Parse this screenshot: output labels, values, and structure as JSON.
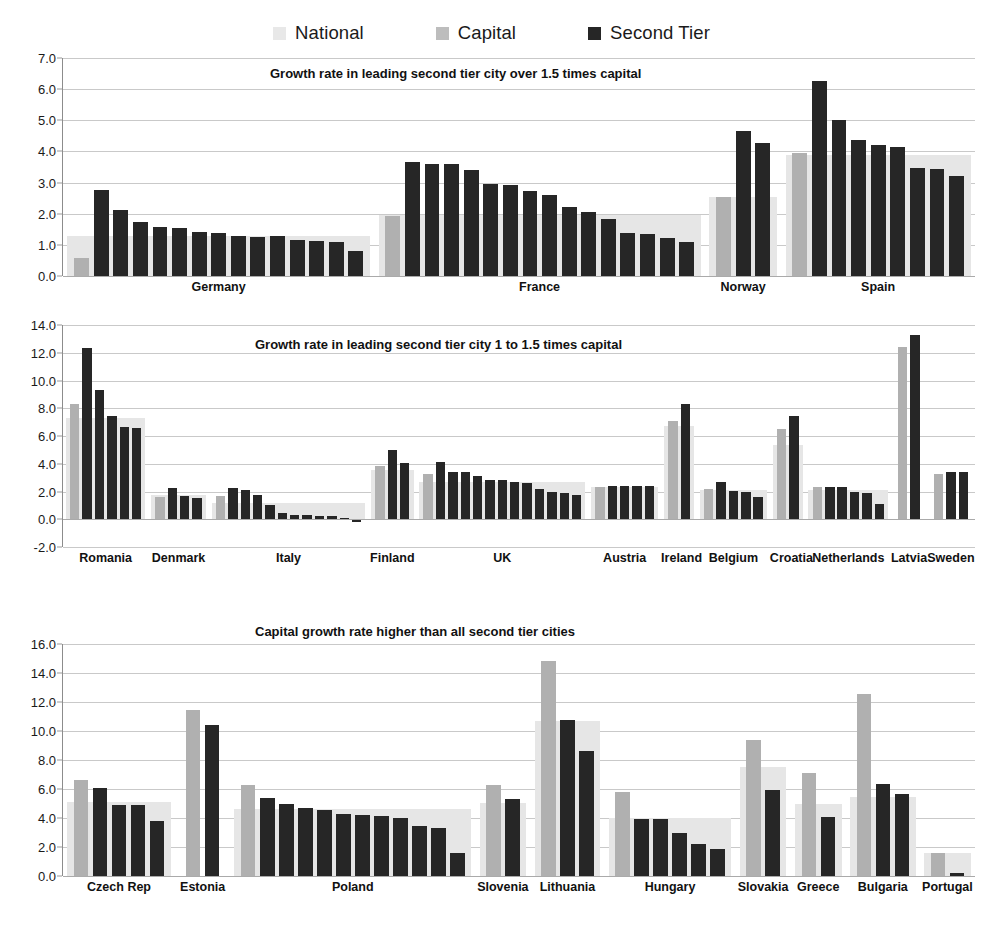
{
  "legend": {
    "entries": [
      {
        "label": "National",
        "color": "#e6e6e6"
      },
      {
        "label": "Capital",
        "color": "#b0b0b0"
      },
      {
        "label": "Second Tier",
        "color": "#262626"
      }
    ]
  },
  "chart_data": [
    {
      "type": "bar",
      "title": "Growth rate in leading second tier city over 1.5 times capital",
      "xlabel": "",
      "ylabel": "",
      "ylim": [
        0.0,
        7.0
      ],
      "yticks": [
        0.0,
        1.0,
        2.0,
        3.0,
        4.0,
        5.0,
        6.0,
        7.0
      ],
      "ytick_labels": [
        "0.0",
        "1.0",
        "2.0",
        "3.0",
        "4.0",
        "5.0",
        "6.0",
        "7.0"
      ],
      "grid": true,
      "legend_position": "top-center",
      "series_names": [
        "National",
        "Capital",
        "Second Tier"
      ],
      "groups": [
        {
          "category": "Germany",
          "national": 1.3,
          "capital": 0.58,
          "second_tier": [
            2.75,
            2.13,
            1.74,
            1.58,
            1.54,
            1.42,
            1.39,
            1.3,
            1.26,
            1.27,
            1.17,
            1.12,
            1.08,
            0.79
          ]
        },
        {
          "category": "France",
          "national": 1.95,
          "capital": 1.92,
          "second_tier": [
            3.67,
            3.6,
            3.59,
            3.42,
            2.96,
            2.93,
            2.72,
            2.6,
            2.23,
            2.07,
            1.84,
            1.38,
            1.35,
            1.22,
            1.1
          ]
        },
        {
          "category": "Norway",
          "national": 2.55,
          "capital": 2.53,
          "second_tier": [
            4.67,
            4.26
          ]
        },
        {
          "category": "Spain",
          "national": 3.88,
          "capital": 3.94,
          "second_tier": [
            6.26,
            5.01,
            4.37,
            4.22,
            4.14,
            3.48,
            3.45,
            3.22
          ]
        }
      ]
    },
    {
      "type": "bar",
      "title": "Growth rate in leading second tier city 1 to 1.5 times capital",
      "xlabel": "",
      "ylabel": "",
      "ylim": [
        -2.0,
        14.0
      ],
      "yticks": [
        -2.0,
        0.0,
        2.0,
        4.0,
        6.0,
        8.0,
        10.0,
        12.0,
        14.0
      ],
      "ytick_labels": [
        "-2.0",
        "0.0",
        "2.0",
        "4.0",
        "6.0",
        "8.0",
        "10.0",
        "12.0",
        "14.0"
      ],
      "grid": true,
      "legend_position": "top-center",
      "series_names": [
        "National",
        "Capital",
        "Second Tier"
      ],
      "groups": [
        {
          "category": "Romania",
          "national": 7.3,
          "capital": 8.28,
          "second_tier": [
            12.37,
            9.3,
            7.45,
            6.62,
            6.55
          ]
        },
        {
          "category": "Denmark",
          "national": 1.72,
          "capital": 1.62,
          "second_tier": [
            2.28,
            1.66,
            1.52
          ]
        },
        {
          "category": "Italy",
          "national": 1.15,
          "capital": 1.68,
          "second_tier": [
            2.25,
            2.1,
            1.74,
            1.05,
            0.44,
            0.33,
            0.3,
            0.24,
            0.2,
            0.12,
            -0.2
          ]
        },
        {
          "category": "Finland",
          "national": 3.58,
          "capital": 3.85,
          "second_tier": [
            4.96,
            4.07
          ]
        },
        {
          "category": "UK",
          "national": 2.66,
          "capital": 3.28,
          "second_tier": [
            4.13,
            3.42,
            3.4,
            3.12,
            2.85,
            2.83,
            2.65,
            2.6,
            2.15,
            1.95,
            1.9,
            1.72
          ]
        },
        {
          "category": "Austria",
          "national": 2.35,
          "capital": 2.32,
          "second_tier": [
            2.4,
            2.4,
            2.38,
            2.37
          ]
        },
        {
          "category": "Ireland",
          "national": 6.72,
          "capital": 7.05,
          "second_tier": [
            8.28
          ]
        },
        {
          "category": "Belgium",
          "national": 2.1,
          "capital": 2.15,
          "second_tier": [
            2.7,
            2.02,
            2.0,
            1.6
          ]
        },
        {
          "category": "Croatia",
          "national": 5.35,
          "capital": 6.5,
          "second_tier": [
            7.42
          ]
        },
        {
          "category": "Netherlands",
          "national": 2.1,
          "capital": 2.3,
          "second_tier": [
            2.32,
            2.3,
            1.95,
            1.92,
            1.12
          ]
        },
        {
          "category": "Latvia",
          "national": 0.0,
          "capital": 12.45,
          "second_tier": [
            13.3
          ]
        },
        {
          "category": "Sweden",
          "national": 0.0,
          "capital": 3.28,
          "second_tier": [
            3.4,
            3.4
          ]
        }
      ]
    },
    {
      "type": "bar",
      "title": "Capital growth rate higher than all second tier cities",
      "xlabel": "",
      "ylabel": "",
      "ylim": [
        0.0,
        16.0
      ],
      "yticks": [
        0.0,
        2.0,
        4.0,
        6.0,
        8.0,
        10.0,
        12.0,
        14.0,
        16.0
      ],
      "ytick_labels": [
        "0.0",
        "2.0",
        "4.0",
        "6.0",
        "8.0",
        "10.0",
        "12.0",
        "14.0",
        "16.0"
      ],
      "grid": true,
      "legend_position": "top-center",
      "series_names": [
        "National",
        "Capital",
        "Second Tier"
      ],
      "groups": [
        {
          "category": "Czech Rep",
          "national": 5.1,
          "capital": 6.62,
          "second_tier": [
            6.08,
            4.88,
            4.88,
            3.82
          ]
        },
        {
          "category": "Estonia",
          "national": 0.0,
          "capital": 11.45,
          "second_tier": [
            10.42
          ]
        },
        {
          "category": "Poland",
          "national": 4.6,
          "capital": 6.28,
          "second_tier": [
            5.35,
            4.98,
            4.72,
            4.52,
            4.3,
            4.18,
            4.16,
            4.0,
            3.45,
            3.28,
            1.58
          ]
        },
        {
          "category": "Slovenia",
          "national": 5.05,
          "capital": 6.28,
          "second_tier": [
            5.28
          ]
        },
        {
          "category": "Lithuania",
          "national": 10.72,
          "capital": 14.85,
          "second_tier": [
            10.75,
            8.65
          ]
        },
        {
          "category": "Hungary",
          "national": 4.02,
          "capital": 5.8,
          "second_tier": [
            3.95,
            3.95,
            3.0,
            2.2,
            1.85
          ]
        },
        {
          "category": "Slovakia",
          "national": 7.55,
          "capital": 9.35,
          "second_tier": [
            5.95
          ]
        },
        {
          "category": "Greece",
          "national": 4.95,
          "capital": 7.08,
          "second_tier": [
            4.08
          ]
        },
        {
          "category": "Bulgaria",
          "national": 5.48,
          "capital": 12.55,
          "second_tier": [
            6.35,
            5.68
          ]
        },
        {
          "category": "Portugal",
          "national": 1.62,
          "capital": 1.58,
          "second_tier": [
            0.18
          ]
        }
      ]
    }
  ]
}
